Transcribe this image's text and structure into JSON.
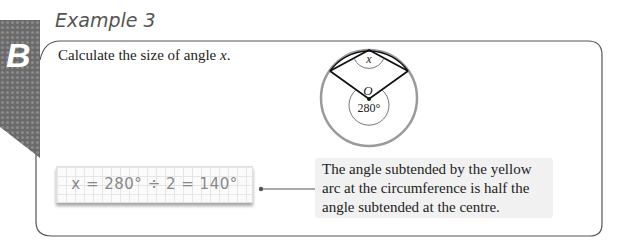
{
  "section_tab": {
    "letter": "B"
  },
  "example": {
    "title": "Example 3",
    "question_prefix": "Calculate the size of angle ",
    "question_var": "x",
    "question_suffix": "."
  },
  "diagram": {
    "angle_label_top": "x",
    "centre_label": "O",
    "centre_angle_label": "280°",
    "colors": {
      "circle": "#9a9a9a",
      "chords": "#111111"
    }
  },
  "working": {
    "equation": "x = 280° ÷ 2 = 140°"
  },
  "callout": {
    "text": "The angle subtended by the yellow arc at the circumference is half the angle subtended at the centre."
  }
}
